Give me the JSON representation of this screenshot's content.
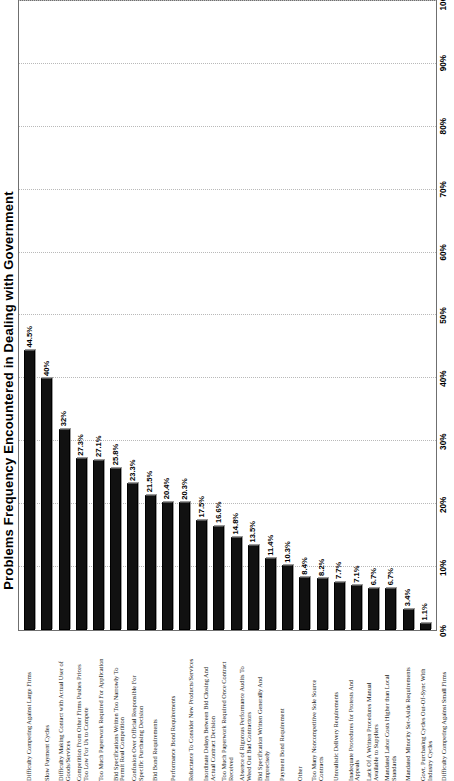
{
  "chart_data": {
    "type": "bar",
    "orientation": "horizontal",
    "title": "Problems Frequency Encountered in Dealing with Government",
    "xlabel": "",
    "ylabel": "",
    "xlim": [
      0,
      100
    ],
    "grid": true,
    "legend": "none",
    "tick_labels": [
      "0%",
      "10%",
      "20%",
      "30%",
      "40%",
      "50%",
      "60%",
      "70%",
      "80%",
      "90%",
      "100%"
    ],
    "tick_values": [
      0,
      10,
      20,
      30,
      40,
      50,
      60,
      70,
      80,
      90,
      100
    ],
    "categories": [
      "Difficulty Competing Against Large Firms",
      "Slow Payment Cycles",
      "Difficulty Making Contact with Actual User of\nGoods/Services",
      "Competition From Other Firms Pushes Prices\nToo Low For Us to Compete",
      "Too Much Paperwork Required For Application",
      "Bid Specifications Written Too Narrowly To\nPermit Real Competition",
      "Confusion Over Official Responsible For\nSpecific Purchasing Decision",
      "Bid Bond Requirements",
      "Performance Bond Requirements",
      "Reluctance To Consider New Products/Services",
      "Inordinate Delays Between Bid Closing And\nActual Contract Decision",
      "Too Much Paperwork Required Once Contract\nReceived",
      "Absence of Rigorous Performance Audits To\nWeed Out Bad Contractors",
      "Bid Specification Written Generally And\nImprecisely",
      "Payment Bond Requirement",
      "Other",
      "Too Many Noncompetitive Sole Source\nContracts",
      "Unrealistic Delivery Requirements",
      "Inadequate Procedures for Protests And\nAppeals",
      "Lack Of A Written Procedures Manual\nAvailable to Suppliers",
      "Mandated Labor Costs Higher than Local\nStandards",
      "Mandated Minority Set-Aside Requirements",
      "Govt. Purchasing Cycles Out-Of-Sync With\nIndustry Cycles",
      "Difficulty Competing Against Small Firms"
    ],
    "values": [
      44.5,
      40,
      32,
      27.3,
      27.1,
      25.8,
      23.3,
      21.5,
      20.4,
      20.3,
      17.5,
      16.6,
      14.8,
      13.5,
      11.4,
      10.3,
      8.4,
      8.2,
      7.7,
      7.1,
      6.7,
      6.7,
      3.4,
      1.1
    ],
    "value_labels": [
      "44.5%",
      "40%",
      "32%",
      "27.3%",
      "27.1%",
      "25.8%",
      "23.3%",
      "21.5%",
      "20.4%",
      "20.3%",
      "17.5%",
      "16.6%",
      "14.8%",
      "13.5%",
      "11.4%",
      "10.3%",
      "8.4%",
      "8.2%",
      "7.7%",
      "7.1%",
      "6.7%",
      "6.7%",
      "3.4%",
      "1.1%"
    ],
    "bar_color": "#111111"
  }
}
